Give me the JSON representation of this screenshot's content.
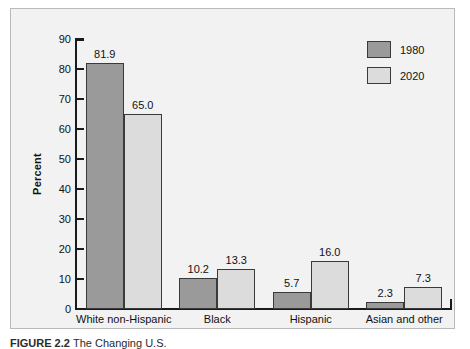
{
  "chart_data": {
    "type": "bar",
    "title": "",
    "subtitle": "",
    "xlabel": "",
    "ylabel": "Percent",
    "ylim": [
      0,
      90
    ],
    "yticks": [
      0,
      10,
      20,
      30,
      40,
      50,
      60,
      70,
      80,
      90
    ],
    "grid": false,
    "legend_position": "top-right",
    "categories": [
      "White non-Hispanic",
      "Black",
      "Hispanic",
      "Asian and other"
    ],
    "series": [
      {
        "name": "1980",
        "color": "#9a9a9a",
        "values": [
          81.9,
          10.2,
          5.7,
          2.3
        ],
        "labels": [
          "81.9",
          "10.2",
          "5.7",
          "2.3"
        ]
      },
      {
        "name": "2020",
        "color": "#dcdcdc",
        "values": [
          65.0,
          13.3,
          16.0,
          7.3
        ],
        "labels": [
          "65.0",
          "13.3",
          "16.0",
          "7.3"
        ]
      }
    ]
  },
  "axis": {
    "y_title": "Percent",
    "y_tick_labels": [
      "90",
      "80",
      "70",
      "60",
      "50",
      "40",
      "30",
      "20",
      "10",
      "0"
    ]
  },
  "legend": {
    "entries": [
      {
        "label": "1980",
        "swatch": "#9a9a9a"
      },
      {
        "label": "2020",
        "swatch": "#dcdcdc"
      }
    ]
  },
  "caption": {
    "prefix": "FIGURE 2.2",
    "text": "The Changing U.S."
  },
  "colors": {
    "panel_background": "#f2f2f2",
    "panel_border": "#b9b9b9",
    "axis": "#1a1a1a",
    "bar_border": "#3a3a3a",
    "series_1980": "#9a9a9a",
    "series_2020": "#dcdcdc",
    "text": "#111111"
  }
}
